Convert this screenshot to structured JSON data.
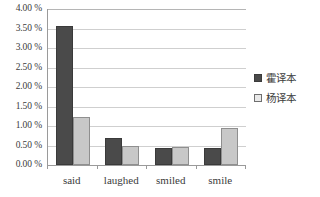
{
  "chart_data": {
    "type": "bar",
    "title": "",
    "subtitle": "",
    "xlabel": "",
    "ylabel": "",
    "categories": [
      "said",
      "laughed",
      "smiled",
      "smile"
    ],
    "series": [
      {
        "name": "霍译本",
        "color": "#4a4a4a",
        "values": [
          3.57,
          0.68,
          0.43,
          0.43
        ]
      },
      {
        "name": "杨译本",
        "color": "#c8c8c8",
        "values": [
          1.24,
          0.5,
          0.47,
          0.95
        ]
      }
    ],
    "ylim": [
      0,
      4
    ],
    "ytick_step": 0.5,
    "ytick_labels": [
      "0.00 %",
      "0.50 %",
      "1.00 %",
      "1.50 %",
      "2.00 %",
      "2.50 %",
      "3.00 %",
      "3.50 %",
      "4.00 %"
    ],
    "ytick_values": [
      0,
      0.5,
      1,
      1.5,
      2,
      2.5,
      3,
      3.5,
      4
    ],
    "value_suffix": "%",
    "grid": true,
    "grid_axis": "y",
    "legend_position": "right",
    "legend_entries": [
      "霍译本",
      "杨译本"
    ],
    "background_color": "#ffffff",
    "gridline_color": "#cfcfcf",
    "axis_color": "#9a9a9a"
  }
}
